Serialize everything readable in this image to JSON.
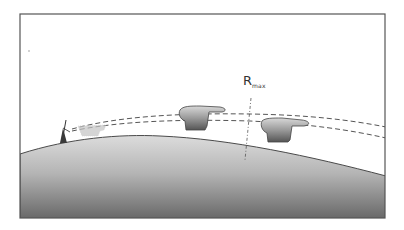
{
  "diagram": {
    "type": "radar-horizon-illustration",
    "frame": {
      "x": 20,
      "y": 14,
      "width": 365,
      "height": 204,
      "stroke": "#555555"
    },
    "colors": {
      "ground_top": "#d8d8d8",
      "ground_bottom": "#6a6a6a",
      "ground_outline": "#4a4a4a",
      "beam": "#555555",
      "aircraft_top": "#d4d4d4",
      "aircraft_bottom": "#5a5a5a",
      "faded_aircraft": "#b8b8b8",
      "antenna": "#3a3a3a"
    },
    "labels": {
      "rmax_main": "R",
      "rmax_sub": "max"
    },
    "elements": [
      {
        "name": "earth-surface",
        "description": "curved horizon / ground"
      },
      {
        "name": "radar-antenna",
        "position": [
          63,
          141
        ]
      },
      {
        "name": "faded-aircraft",
        "position": [
          92,
          131
        ]
      },
      {
        "name": "aircraft-1",
        "position": [
          200,
          118
        ]
      },
      {
        "name": "aircraft-2",
        "position": [
          285,
          130
        ]
      },
      {
        "name": "radar-beam-upper",
        "style": "dashed"
      },
      {
        "name": "radar-beam-lower",
        "style": "dashed"
      },
      {
        "name": "rmax-line",
        "style": "dash-dot"
      }
    ]
  }
}
